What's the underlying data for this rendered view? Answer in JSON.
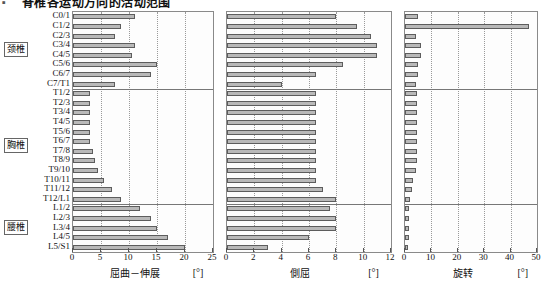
{
  "title": {
    "bullet": "▪",
    "text": "脊椎各运动方向的活动范围"
  },
  "regions": [
    {
      "label": "颈椎",
      "name": "cervical"
    },
    {
      "label": "胸椎",
      "name": "thoracic"
    },
    {
      "label": "腰椎",
      "name": "lumbar"
    }
  ],
  "levels": [
    "C0/1",
    "C1/2",
    "C2/3",
    "C3/4",
    "C4/5",
    "C5/6",
    "C6/7",
    "C7/T1",
    "T1/2",
    "T2/3",
    "T3/4",
    "T4/5",
    "T5/6",
    "T6/7",
    "T7/8",
    "T8/9",
    "T9/10",
    "T10/11",
    "T11/12",
    "T12/L1",
    "L1/2",
    "L2/3",
    "L3/4",
    "L4/5",
    "L5/S1"
  ],
  "chart_data": [
    {
      "type": "bar",
      "orientation": "horizontal",
      "title": "屈曲－伸展",
      "unit": "[°]",
      "xlabel": "屈曲－伸展",
      "ylabel": "",
      "xlim": [
        0,
        25
      ],
      "xticks": [
        0,
        5,
        10,
        15,
        20,
        25
      ],
      "grid": true,
      "categories": [
        "C0/1",
        "C1/2",
        "C2/3",
        "C3/4",
        "C4/5",
        "C5/6",
        "C6/7",
        "C7/T1",
        "T1/2",
        "T2/3",
        "T3/4",
        "T4/5",
        "T5/6",
        "T6/7",
        "T7/8",
        "T8/9",
        "T9/10",
        "T10/11",
        "T11/12",
        "T12/L1",
        "L1/2",
        "L2/3",
        "L3/4",
        "L4/5",
        "L5/S1"
      ],
      "values": [
        11.0,
        8.5,
        7.5,
        11.0,
        10.5,
        15.0,
        14.0,
        7.5,
        3.0,
        3.0,
        3.0,
        3.0,
        3.0,
        3.0,
        3.5,
        4.0,
        4.5,
        5.5,
        7.0,
        8.5,
        12.0,
        14.0,
        15.0,
        17.0,
        20.0
      ]
    },
    {
      "type": "bar",
      "orientation": "horizontal",
      "title": "側屈",
      "unit": "[°]",
      "xlabel": "側屈",
      "ylabel": "",
      "xlim": [
        0,
        12
      ],
      "xticks": [
        0,
        2,
        4,
        6,
        8,
        10,
        12
      ],
      "grid": true,
      "categories": [
        "C0/1",
        "C1/2",
        "C2/3",
        "C3/4",
        "C4/5",
        "C5/6",
        "C6/7",
        "C7/T1",
        "T1/2",
        "T2/3",
        "T3/4",
        "T4/5",
        "T5/6",
        "T6/7",
        "T7/8",
        "T8/9",
        "T9/10",
        "T10/11",
        "T11/12",
        "T12/L1",
        "L1/2",
        "L2/3",
        "L3/4",
        "L4/5",
        "L5/S1"
      ],
      "values": [
        8.0,
        9.5,
        10.5,
        11.0,
        11.0,
        8.5,
        6.5,
        4.0,
        6.5,
        6.5,
        6.5,
        6.5,
        6.5,
        6.5,
        6.5,
        6.5,
        6.5,
        6.5,
        7.0,
        8.0,
        7.5,
        8.0,
        8.0,
        6.0,
        3.0
      ]
    },
    {
      "type": "bar",
      "orientation": "horizontal",
      "title": "旋转",
      "unit": "[°]",
      "xlabel": "旋转",
      "ylabel": "",
      "xlim": [
        0,
        50
      ],
      "xticks": [
        0,
        10,
        20,
        30,
        40,
        50
      ],
      "grid": true,
      "categories": [
        "C0/1",
        "C1/2",
        "C2/3",
        "C3/4",
        "C4/5",
        "C5/6",
        "C6/7",
        "C7/T1",
        "T1/2",
        "T2/3",
        "T3/4",
        "T4/5",
        "T5/6",
        "T6/7",
        "T7/8",
        "T8/9",
        "T9/10",
        "T10/11",
        "T11/12",
        "T12/L1",
        "L1/2",
        "L2/3",
        "L3/4",
        "L4/5",
        "L5/S1"
      ],
      "values": [
        5.0,
        47.0,
        4.0,
        6.0,
        6.0,
        5.0,
        5.0,
        4.0,
        4.5,
        4.5,
        4.5,
        4.5,
        4.5,
        4.5,
        4.5,
        4.5,
        4.0,
        3.0,
        2.5,
        2.0,
        1.5,
        1.5,
        1.5,
        1.5,
        1.0
      ]
    }
  ],
  "colors": {
    "bar_fill": "#b9b9b9",
    "bar_stroke": "#5d5d5d",
    "frame": "#8a8a8a",
    "grid": "#9a9a9a",
    "text": "#111111"
  }
}
